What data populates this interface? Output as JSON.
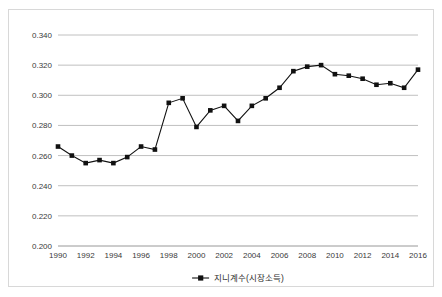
{
  "chart_data": {
    "type": "line",
    "title": "",
    "xlabel": "",
    "ylabel": "",
    "legend_position": "bottom",
    "grid": true,
    "ylim": [
      0.2,
      0.34
    ],
    "ytick_step": 0.02,
    "ytick_labels": [
      "0.340",
      "0.320",
      "0.300",
      "0.280",
      "0.260",
      "0.240",
      "0.220",
      "0.200"
    ],
    "ytick_values": [
      0.34,
      0.32,
      0.3,
      0.28,
      0.26,
      0.24,
      0.22,
      0.2
    ],
    "xlim": [
      1990,
      2016
    ],
    "xtick_labels": [
      "1990",
      "1992",
      "1994",
      "1996",
      "1998",
      "2000",
      "2002",
      "2004",
      "2006",
      "2008",
      "2010",
      "2012",
      "2014",
      "2016"
    ],
    "xtick_values": [
      1990,
      1992,
      1994,
      1996,
      1998,
      2000,
      2002,
      2004,
      2006,
      2008,
      2010,
      2012,
      2014,
      2016
    ],
    "x": [
      1990,
      1991,
      1992,
      1993,
      1994,
      1995,
      1996,
      1997,
      1998,
      1999,
      2000,
      2001,
      2002,
      2003,
      2004,
      2005,
      2006,
      2007,
      2008,
      2009,
      2010,
      2011,
      2012,
      2013,
      2014,
      2015,
      2016
    ],
    "series": [
      {
        "name": "지니계수(시장소득)",
        "color": "#111111",
        "marker": "square",
        "values": [
          0.266,
          0.26,
          0.255,
          0.257,
          0.255,
          0.259,
          0.266,
          0.264,
          0.295,
          0.298,
          0.279,
          0.29,
          0.293,
          0.283,
          0.293,
          0.298,
          0.305,
          0.316,
          0.319,
          0.32,
          0.314,
          0.313,
          0.311,
          0.307,
          0.308,
          0.305,
          0.317
        ]
      }
    ]
  },
  "legend": {
    "entries": [
      {
        "label": "지니계수(시장소득)"
      }
    ]
  }
}
